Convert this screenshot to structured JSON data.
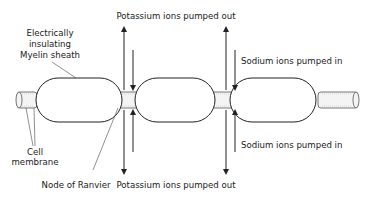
{
  "diagram": {
    "labels": {
      "myelin": [
        "Electrically",
        "insulating",
        "Myelin sheath"
      ],
      "cell_membrane": [
        "Cell",
        "membrane"
      ],
      "node": "Node of Ranvier",
      "potassium_top": "Potassium ions pumped out",
      "potassium_bottom": "Potassium ions pumped out",
      "sodium_top": "Sodium ions pumped in",
      "sodium_bottom": "Sodium ions pumped in"
    },
    "segments": [
      "myelin-segment-1",
      "myelin-segment-2",
      "myelin-segment-3"
    ],
    "nodes": [
      "node-1",
      "node-2"
    ],
    "colors": {
      "line": "#222222",
      "tube_fill": "#f4f4f4",
      "background": "#ffffff"
    }
  }
}
